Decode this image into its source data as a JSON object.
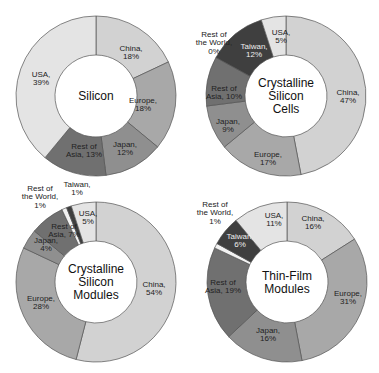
{
  "colors": {
    "China": "#d2d2d2",
    "Europe": "#a8a8a8",
    "Japan": "#8f8f8f",
    "Rest of Asia": "#707070",
    "Taiwan": "#3f3f3f",
    "Rest of the World": "#f2f2f2",
    "USA": "#e4e4e4",
    "stroke": "#555555"
  },
  "chart_data": [
    {
      "type": "pie",
      "variant": "donut",
      "title": "Silicon",
      "categories": [
        "China",
        "Europe",
        "Japan",
        "Rest of Asia",
        "USA"
      ],
      "values": [
        18,
        18,
        12,
        13,
        39
      ],
      "labels": [
        "China,\n18%",
        "Europe,\n18%",
        "Japan,\n12%",
        "Rest of\nAsia, 13%",
        "USA,\n39%"
      ],
      "unit": "%"
    },
    {
      "type": "pie",
      "variant": "donut",
      "title": "Crystalline Silicon Cells",
      "categories": [
        "China",
        "Europe",
        "Japan",
        "Rest of Asia",
        "Rest of the World",
        "Taiwan",
        "USA"
      ],
      "values": [
        47,
        17,
        9,
        10,
        0,
        12,
        5
      ],
      "labels": [
        "China,\n47%",
        "Europe,\n17%",
        "Japan,\n9%",
        "Rest of\nAsia, 10%",
        "Rest of\nthe World,\n0%",
        "Taiwan,\n12%",
        "USA,\n5%"
      ],
      "unit": "%"
    },
    {
      "type": "pie",
      "variant": "donut",
      "title": "Crystalline Silicon Modules",
      "categories": [
        "China",
        "Europe",
        "Japan",
        "Rest of Asia",
        "Rest of the World",
        "Taiwan",
        "USA"
      ],
      "values": [
        54,
        28,
        4,
        7,
        1,
        1,
        5
      ],
      "labels": [
        "China,\n54%",
        "Europe,\n28%",
        "Japan,\n4%",
        "Rest of\nAsia, 7%",
        "Rest of\nthe World,\n1%",
        "Taiwan,\n1%",
        "USA,\n5%"
      ],
      "unit": "%"
    },
    {
      "type": "pie",
      "variant": "donut",
      "title": "Thin-Film Modules",
      "categories": [
        "China",
        "Europe",
        "Japan",
        "Rest of Asia",
        "Rest of the World",
        "Taiwan",
        "USA"
      ],
      "values": [
        16,
        31,
        16,
        19,
        1,
        6,
        11
      ],
      "labels": [
        "China,\n16%",
        "Europe,\n31%",
        "Japan,\n16%",
        "Rest of\nAsia, 19%",
        "Rest of\nthe World,\n1%",
        "Taiwan,\n6%",
        "USA,\n11%"
      ],
      "unit": "%"
    }
  ],
  "layout": [
    {
      "cx": 96,
      "cy": 96,
      "r_outer": 80,
      "r_inner": 41,
      "title_lines": [
        "Silicon"
      ],
      "label_pos": [
        [
          131,
          52
        ],
        [
          143,
          104
        ],
        [
          125,
          148
        ],
        [
          84,
          150
        ],
        [
          41,
          78
        ]
      ],
      "label_color": [
        "#222",
        "#222",
        "#222",
        "#222",
        "#222"
      ]
    },
    {
      "cx": 286,
      "cy": 96,
      "r_outer": 80,
      "r_inner": 41,
      "title_lines": [
        "Crystalline",
        "Silicon",
        "Cells"
      ],
      "label_pos": [
        [
          348,
          96
        ],
        [
          268,
          158
        ],
        [
          228,
          125
        ],
        [
          224,
          92
        ],
        [
          214,
          42
        ],
        [
          254,
          50
        ],
        [
          281,
          36
        ]
      ],
      "label_color": [
        "#222",
        "#222",
        "#222",
        "#222",
        "#222",
        "#eeeeee",
        "#222"
      ],
      "outside": [
        false,
        false,
        false,
        false,
        true,
        false,
        false
      ]
    },
    {
      "cx": 96,
      "cy": 282,
      "r_outer": 80,
      "r_inner": 41,
      "title_lines": [
        "Crystalline",
        "Silicon",
        "Modules"
      ],
      "label_pos": [
        [
          154,
          288
        ],
        [
          41,
          302
        ],
        [
          46,
          244
        ],
        [
          64,
          230
        ],
        [
          40,
          196
        ],
        [
          77,
          188
        ],
        [
          88,
          217
        ]
      ],
      "label_color": [
        "#222",
        "#222",
        "#222",
        "#222",
        "#222",
        "#222",
        "#222"
      ],
      "outside": [
        false,
        false,
        false,
        false,
        true,
        true,
        false
      ]
    },
    {
      "cx": 287,
      "cy": 282,
      "r_outer": 80,
      "r_inner": 41,
      "title_lines": [
        "Thin-Film",
        "Modules"
      ],
      "label_pos": [
        [
          313,
          222
        ],
        [
          348,
          297
        ],
        [
          268,
          334
        ],
        [
          223,
          286
        ],
        [
          215,
          212
        ],
        [
          240,
          240
        ],
        [
          274,
          219
        ]
      ],
      "label_color": [
        "#222",
        "#222",
        "#222",
        "#222",
        "#222",
        "#eeeeee",
        "#222"
      ],
      "outside": [
        false,
        false,
        false,
        false,
        true,
        false,
        false
      ]
    }
  ]
}
